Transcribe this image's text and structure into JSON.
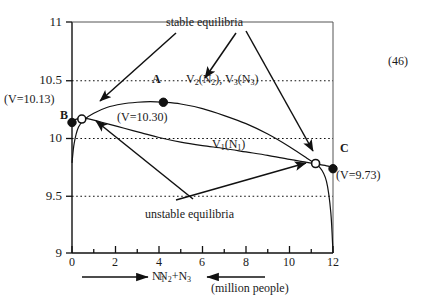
{
  "figure": {
    "equation_number": "(46)",
    "axis_x_label_left": "N",
    "axis_x_label_left_sub": "1",
    "axis_x_label_right": "N",
    "axis_x_label_right_sub2": "2",
    "axis_x_label_right_plus": "+N",
    "axis_x_label_right_sub3": "3",
    "axis_x_units": "(million people)"
  },
  "chart_data": {
    "type": "line",
    "title": "",
    "xlabel": "N1  /  N2+N3 (million people)",
    "ylabel": "V",
    "xlim": [
      0,
      12
    ],
    "ylim": [
      9,
      11
    ],
    "grid": true,
    "grid_lines_y": [
      10.5,
      10,
      9.5
    ],
    "xticks": [
      0,
      2,
      4,
      6,
      8,
      10,
      12
    ],
    "xtick_labels": [
      "0",
      "2",
      "4",
      "6",
      "8",
      "10",
      "12"
    ],
    "yticks": [
      11,
      10.5,
      10,
      9.5,
      9
    ],
    "ytick_labels": [
      "11",
      "10.5",
      "10",
      "9.5",
      "9"
    ],
    "legend_position": "inline-annotations",
    "series": [
      {
        "name": "V2(N2), V3(N3)",
        "label_text": "V",
        "label_sub_a": "2",
        "label_mid": "(N",
        "label_sub_b": "2",
        "label_mid2": "), V",
        "label_sub_c": "3",
        "label_mid3": "(N",
        "label_sub_d": "3",
        "label_end": ")",
        "x": [
          0.0,
          0.1,
          0.3,
          0.6,
          1.0,
          1.6,
          2.3,
          3.0,
          3.6,
          4.2,
          5.0,
          6.0,
          7.0,
          8.0,
          9.0,
          10.0,
          10.8,
          11.4,
          11.7,
          11.9,
          12.0
        ],
        "y": [
          9.78,
          9.95,
          10.09,
          10.16,
          10.21,
          10.26,
          10.29,
          10.305,
          10.31,
          10.305,
          10.29,
          10.25,
          10.19,
          10.12,
          10.03,
          9.92,
          9.82,
          9.74,
          9.62,
          9.35,
          9.0
        ]
      },
      {
        "name": "V1(N1)",
        "label_text": "V",
        "label_sub_a": "1",
        "label_mid": "(N",
        "label_sub_b": "1",
        "label_end": ")",
        "x": [
          0.0,
          0.15,
          0.35,
          0.6,
          1.0,
          1.6,
          2.4,
          3.2,
          4.0,
          5.0,
          6.0,
          7.0,
          8.0,
          9.0,
          10.0,
          10.8,
          11.4,
          11.7,
          11.9,
          12.0
        ],
        "y": [
          10.13,
          10.155,
          10.165,
          10.165,
          10.15,
          10.12,
          10.08,
          10.04,
          10.0,
          9.96,
          9.93,
          9.905,
          9.875,
          9.845,
          9.81,
          9.785,
          9.765,
          9.755,
          9.745,
          9.73
        ]
      }
    ],
    "points": [
      {
        "id": "B",
        "label": "B",
        "value_label": "(V=10.13)",
        "x": 0.0,
        "y": 10.13,
        "marker": "filled",
        "stability": "stable"
      },
      {
        "id": "u1",
        "label": "",
        "value_label": "",
        "x": 0.45,
        "y": 10.16,
        "marker": "open",
        "stability": "unstable"
      },
      {
        "id": "A",
        "label": "A",
        "value_label": "(V=10.30)",
        "x": 4.2,
        "y": 10.305,
        "marker": "filled",
        "stability": "stable"
      },
      {
        "id": "u2",
        "label": "",
        "value_label": "",
        "x": 11.2,
        "y": 9.775,
        "marker": "open",
        "stability": "unstable"
      },
      {
        "id": "C",
        "label": "C",
        "value_label": "(V=9.73)",
        "x": 12.0,
        "y": 9.73,
        "marker": "filled",
        "stability": "stable"
      }
    ],
    "annotations": [
      {
        "id": "stable",
        "text": "stable equilibria"
      },
      {
        "id": "unstable",
        "text": "unstable equilibria"
      }
    ]
  }
}
